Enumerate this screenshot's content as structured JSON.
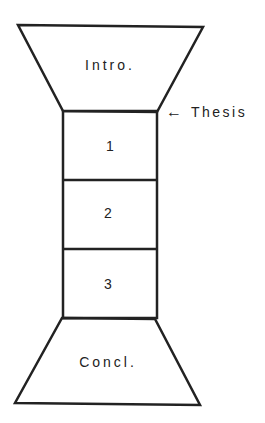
{
  "diagram": {
    "type": "essay-structure-hourglass",
    "sections": [
      {
        "id": "intro",
        "label": "Intro."
      },
      {
        "id": "body1",
        "label": "1"
      },
      {
        "id": "body2",
        "label": "2"
      },
      {
        "id": "body3",
        "label": "3"
      },
      {
        "id": "conclusion",
        "label": "Concl."
      }
    ],
    "annotation": {
      "label": "Thesis",
      "arrow": "←"
    },
    "colors": {
      "stroke": "#222222",
      "background": "#ffffff"
    }
  }
}
